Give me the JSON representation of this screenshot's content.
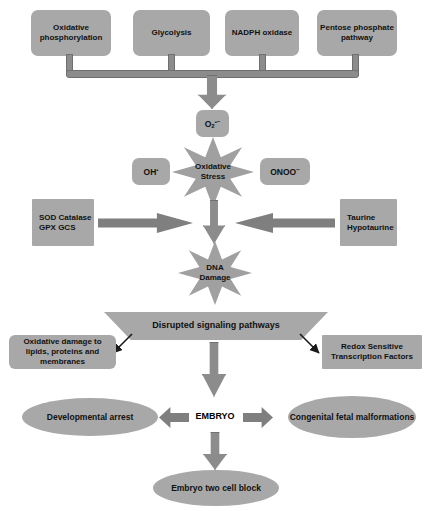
{
  "diagram": {
    "palette": {
      "node_fill": "#a8a8a8",
      "star_fill": "#a0a0a0",
      "connector_fill": "#8c8c8c",
      "arrow_fill": "#7f7f7f",
      "background": "#ffffff",
      "text": "#111111"
    },
    "sources": [
      {
        "id": "oxidative-phosphorylation",
        "label": "Oxidative phosphorylation"
      },
      {
        "id": "glycolysis",
        "label": "Glycolysis"
      },
      {
        "id": "nadph-oxidase",
        "label": "NADPH oxidase"
      },
      {
        "id": "pentose-phosphate-pathway",
        "label": "Pentose phosphate pathway"
      }
    ],
    "radicals": {
      "superoxide": {
        "id": "superoxide",
        "base": "O",
        "subscript": "2",
        "superscript": "•−"
      },
      "hydroxyl": {
        "id": "hydroxyl",
        "base": "OH",
        "superscript": "•"
      },
      "peroxynitrite": {
        "id": "peroxynitrite",
        "base": "ONOO",
        "superscript": "−"
      }
    },
    "stars": [
      {
        "id": "oxidative-stress",
        "line1": "Oxidative",
        "line2": "Stress"
      },
      {
        "id": "dna-damage",
        "line1": "DNA",
        "line2": "Damage"
      }
    ],
    "antioxidants": {
      "id": "enzymatic-antioxidants",
      "items": [
        "SOD",
        "Catalase",
        "GPX",
        "GCS"
      ]
    },
    "taurine": {
      "id": "taurine-hypotaurine",
      "items": [
        "Taurine",
        "Hypotaurine"
      ]
    },
    "banner": {
      "id": "disrupted-signaling-pathways",
      "label": "Disrupted signaling pathways"
    },
    "consequences": [
      {
        "id": "oxidative-damage",
        "line1": "Oxidative damage to lipids,",
        "line2": "proteins and membranes"
      },
      {
        "id": "redox-sensitive-tf",
        "line1": "Redox Sensitive",
        "line2": "Transcription Factors"
      }
    ],
    "embryo": {
      "id": "embryo",
      "label": "EMBRYO"
    },
    "outcomes": [
      {
        "id": "developmental-arrest",
        "line1": "Developmental arrest",
        "line2": ""
      },
      {
        "id": "congenital-fetal-malformations",
        "line1": "Congenital fetal",
        "line2": "malformations"
      },
      {
        "id": "embryo-two-cell-block",
        "line1": "Embryo two cell block",
        "line2": ""
      }
    ]
  }
}
